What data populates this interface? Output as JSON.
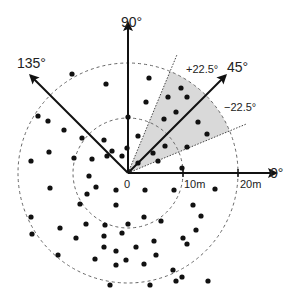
{
  "diagram": {
    "origin": {
      "x": 128,
      "y": 173
    },
    "origin_label": "0",
    "rings": [
      {
        "name": "inner-ring",
        "radius_px": 55,
        "label": "10m"
      },
      {
        "name": "outer-ring",
        "radius_px": 110,
        "label": "20m"
      }
    ],
    "axes": [
      {
        "name": "axis-0",
        "angle_deg": 0,
        "label": "0°",
        "length_px": 148
      },
      {
        "name": "axis-45",
        "angle_deg": 45,
        "label": "45°",
        "length_px": 138
      },
      {
        "name": "axis-90",
        "angle_deg": 90,
        "label": "90°",
        "length_px": 150
      },
      {
        "name": "axis-135",
        "angle_deg": 135,
        "label": "135°",
        "length_px": 138
      }
    ],
    "sector": {
      "center_angle_deg": 45,
      "half_width_deg": 22.5,
      "upper_label": "+22.5°",
      "lower_label": "−22.5°",
      "fill": "#d9d9d9"
    },
    "colors": {
      "axis": "#111111",
      "ring": "#666666",
      "dot": "#111111",
      "sector_fill": "#d9d9d9",
      "sector_edge": "#444444"
    },
    "points": [
      [
        72,
        74
      ],
      [
        106,
        84
      ],
      [
        38,
        116
      ],
      [
        48,
        121
      ],
      [
        64,
        130
      ],
      [
        82,
        138
      ],
      [
        104,
        140
      ],
      [
        128,
        117
      ],
      [
        138,
        136
      ],
      [
        149,
        78
      ],
      [
        146,
        102
      ],
      [
        168,
        97
      ],
      [
        164,
        119
      ],
      [
        127,
        148
      ],
      [
        122,
        156
      ],
      [
        112,
        151
      ],
      [
        138,
        163
      ],
      [
        181,
        88
      ],
      [
        187,
        97
      ],
      [
        176,
        112
      ],
      [
        198,
        122
      ],
      [
        207,
        134
      ],
      [
        187,
        147
      ],
      [
        182,
        168
      ],
      [
        165,
        146
      ],
      [
        158,
        161
      ],
      [
        153,
        153
      ],
      [
        31,
        161
      ],
      [
        49,
        152
      ],
      [
        74,
        158
      ],
      [
        92,
        159
      ],
      [
        107,
        156
      ],
      [
        89,
        176
      ],
      [
        96,
        187
      ],
      [
        87,
        194
      ],
      [
        50,
        188
      ],
      [
        80,
        204
      ],
      [
        116,
        190
      ],
      [
        145,
        190
      ],
      [
        174,
        190
      ],
      [
        215,
        189
      ],
      [
        31,
        217
      ],
      [
        32,
        234
      ],
      [
        60,
        228
      ],
      [
        76,
        238
      ],
      [
        86,
        224
      ],
      [
        105,
        225
      ],
      [
        116,
        205
      ],
      [
        128,
        224
      ],
      [
        144,
        217
      ],
      [
        161,
        221
      ],
      [
        193,
        205
      ],
      [
        201,
        216
      ],
      [
        196,
        230
      ],
      [
        183,
        238
      ],
      [
        187,
        244
      ],
      [
        173,
        270
      ],
      [
        104,
        247
      ],
      [
        116,
        251
      ],
      [
        136,
        247
      ],
      [
        154,
        241
      ],
      [
        122,
        233
      ],
      [
        104,
        236
      ],
      [
        58,
        255
      ],
      [
        95,
        259
      ],
      [
        116,
        265
      ],
      [
        126,
        260
      ],
      [
        110,
        285
      ],
      [
        144,
        264
      ],
      [
        176,
        281
      ],
      [
        156,
        255
      ],
      [
        208,
        281
      ],
      [
        150,
        285
      ],
      [
        182,
        277
      ]
    ]
  }
}
